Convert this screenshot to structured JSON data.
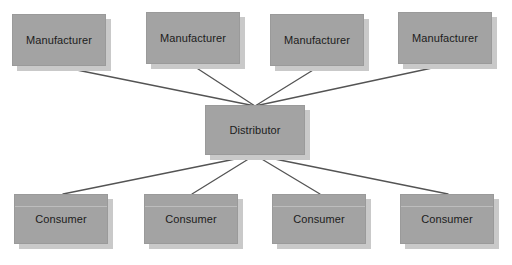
{
  "diagram": {
    "type": "hub-and-spoke",
    "canvas": {
      "width": 512,
      "height": 265,
      "background": "#ffffff"
    },
    "style": {
      "node_fill": "#a3a3a3",
      "node_border": "#9a9a9a",
      "node_shadow": "#c9c9c9",
      "label_color": "#1c1c1c",
      "connector_color": "#545454",
      "divider_color": "#bdbdbd"
    },
    "hub": {
      "id": "distributor",
      "label": "Distributor",
      "x": 205,
      "y": 105,
      "width": 100,
      "height": 50,
      "has_divider": false
    },
    "top_tier": {
      "role": "Manufacturer",
      "count": 4,
      "nodes": [
        {
          "id": "manufacturer-1",
          "label": "Manufacturer",
          "x": 12,
          "y": 14,
          "width": 94,
          "height": 52,
          "has_divider": false
        },
        {
          "id": "manufacturer-2",
          "label": "Manufacturer",
          "x": 146,
          "y": 12,
          "width": 94,
          "height": 52,
          "has_divider": false
        },
        {
          "id": "manufacturer-3",
          "label": "Manufacturer",
          "x": 270,
          "y": 14,
          "width": 94,
          "height": 52,
          "has_divider": false
        },
        {
          "id": "manufacturer-4",
          "label": "Manufacturer",
          "x": 398,
          "y": 12,
          "width": 94,
          "height": 52,
          "has_divider": false
        }
      ]
    },
    "bottom_tier": {
      "role": "Consumer",
      "count": 4,
      "nodes": [
        {
          "id": "consumer-1",
          "label": "Consumer",
          "x": 14,
          "y": 194,
          "width": 94,
          "height": 50,
          "has_divider": true
        },
        {
          "id": "consumer-2",
          "label": "Consumer",
          "x": 144,
          "y": 194,
          "width": 94,
          "height": 50,
          "has_divider": true
        },
        {
          "id": "consumer-3",
          "label": "Consumer",
          "x": 272,
          "y": 194,
          "width": 94,
          "height": 50,
          "has_divider": true
        },
        {
          "id": "consumer-4",
          "label": "Consumer",
          "x": 400,
          "y": 194,
          "width": 94,
          "height": 50,
          "has_divider": true
        }
      ]
    },
    "connectors": [
      {
        "id": "link-manufacturer-1",
        "from": "manufacturer-1",
        "to": "distributor",
        "x1": 62,
        "y1": 67,
        "x2": 255,
        "y2": 106
      },
      {
        "id": "link-manufacturer-2",
        "from": "manufacturer-2",
        "to": "distributor",
        "x1": 192,
        "y1": 65,
        "x2": 255,
        "y2": 106
      },
      {
        "id": "link-manufacturer-3",
        "from": "manufacturer-3",
        "to": "distributor",
        "x1": 318,
        "y1": 67,
        "x2": 255,
        "y2": 106
      },
      {
        "id": "link-manufacturer-4",
        "from": "manufacturer-4",
        "to": "distributor",
        "x1": 446,
        "y1": 65,
        "x2": 255,
        "y2": 106
      },
      {
        "id": "link-consumer-1",
        "from": "distributor",
        "to": "consumer-1",
        "x1": 255,
        "y1": 155,
        "x2": 63,
        "y2": 194
      },
      {
        "id": "link-consumer-2",
        "from": "distributor",
        "to": "consumer-2",
        "x1": 255,
        "y1": 155,
        "x2": 192,
        "y2": 194
      },
      {
        "id": "link-consumer-3",
        "from": "distributor",
        "to": "consumer-3",
        "x1": 255,
        "y1": 155,
        "x2": 320,
        "y2": 194
      },
      {
        "id": "link-consumer-4",
        "from": "distributor",
        "to": "consumer-4",
        "x1": 255,
        "y1": 155,
        "x2": 448,
        "y2": 194
      }
    ]
  }
}
